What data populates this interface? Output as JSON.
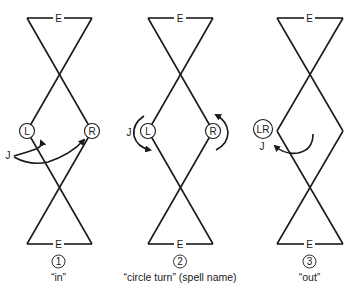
{
  "diagram": {
    "panels": [
      {
        "number": "1",
        "caption": "“in”",
        "top_label": "E",
        "bottom_label": "E",
        "dancers": [
          "L",
          "R"
        ],
        "actor_label": "J"
      },
      {
        "number": "2",
        "caption": "“circle turn” (spell name)",
        "top_label": "E",
        "bottom_label": "E",
        "dancers": [
          "L",
          "R"
        ],
        "actor_label": "J"
      },
      {
        "number": "3",
        "caption": "“out”",
        "top_label": "E",
        "bottom_label": "E",
        "dancers": [
          "LR"
        ],
        "actor_label": "J"
      }
    ],
    "colors": {
      "line": "#1a1a1a",
      "background": "#ffffff"
    }
  }
}
